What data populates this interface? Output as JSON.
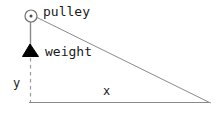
{
  "diagram": {
    "background_color": "#ffffff",
    "stroke_color": "#808080",
    "fill_color": "#000000",
    "text_color": "#1a1a1a",
    "width": 224,
    "height": 119,
    "labels": {
      "pulley": "pulley",
      "weight": "weight",
      "y_axis": "y",
      "x_axis": "x"
    },
    "elements": {
      "pulley_circle": {
        "name": "pulley-circle",
        "cx": 31,
        "cy": 16,
        "r": 6
      },
      "pulley_hub": {
        "name": "pulley-hub-dot",
        "cx": 31,
        "cy": 16,
        "r": 1.4
      },
      "rope_vertical": {
        "name": "rope-vertical-segment",
        "x1": 30,
        "y1": 21,
        "x2": 30,
        "y2": 48
      },
      "rope_diagonal": {
        "name": "rope-diagonal-segment",
        "x1": 36,
        "y1": 17,
        "x2": 210,
        "y2": 103
      },
      "weight_shape": {
        "name": "weight-trapezoid",
        "points": "30,45 21,57 40,57"
      },
      "y_dashed_line": {
        "name": "y-dashed-axis-line",
        "x1": 30,
        "y1": 58,
        "x2": 30,
        "y2": 102
      },
      "x_baseline": {
        "name": "x-baseline-axis-line",
        "x1": 29,
        "y1": 103,
        "x2": 210,
        "y2": 103
      }
    }
  }
}
